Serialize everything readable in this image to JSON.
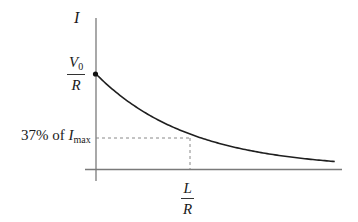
{
  "chart_data": {
    "type": "line",
    "title": "",
    "ylabel": "I",
    "xlabel": "",
    "grid": false,
    "legend": null,
    "y_ticks": [
      {
        "label": "V0/R",
        "value": 1.0,
        "marker": "dot"
      },
      {
        "label": "37% of I_max",
        "value": 0.37,
        "guide": "dashed"
      }
    ],
    "x_ticks": [
      {
        "label": "L/R",
        "value": 1.0,
        "guide": "dashed"
      }
    ],
    "series": [
      {
        "name": "I(t)",
        "x": [
          0,
          0.25,
          0.5,
          0.75,
          1.0,
          1.25,
          1.5,
          1.75,
          2.0,
          2.25,
          2.54
        ],
        "values": [
          1.0,
          0.779,
          0.607,
          0.472,
          0.368,
          0.287,
          0.223,
          0.174,
          0.135,
          0.105,
          0.079
        ]
      }
    ],
    "xlim": [
      0,
      2.6
    ],
    "ylim": [
      0,
      1.45
    ]
  },
  "labels": {
    "y_axis": "I",
    "v0_numerator_letter": "V",
    "v0_subscript": "0",
    "v0_denominator": "R",
    "percent_text": "37% of ",
    "imax_letter": "I",
    "imax_subscript": "max",
    "lr_numerator": "L",
    "lr_denominator": "R"
  },
  "colors": {
    "axis": "#7a7a7a",
    "curve": "#1f1f1f",
    "guide": "#888888",
    "text": "#1a1a1a"
  }
}
